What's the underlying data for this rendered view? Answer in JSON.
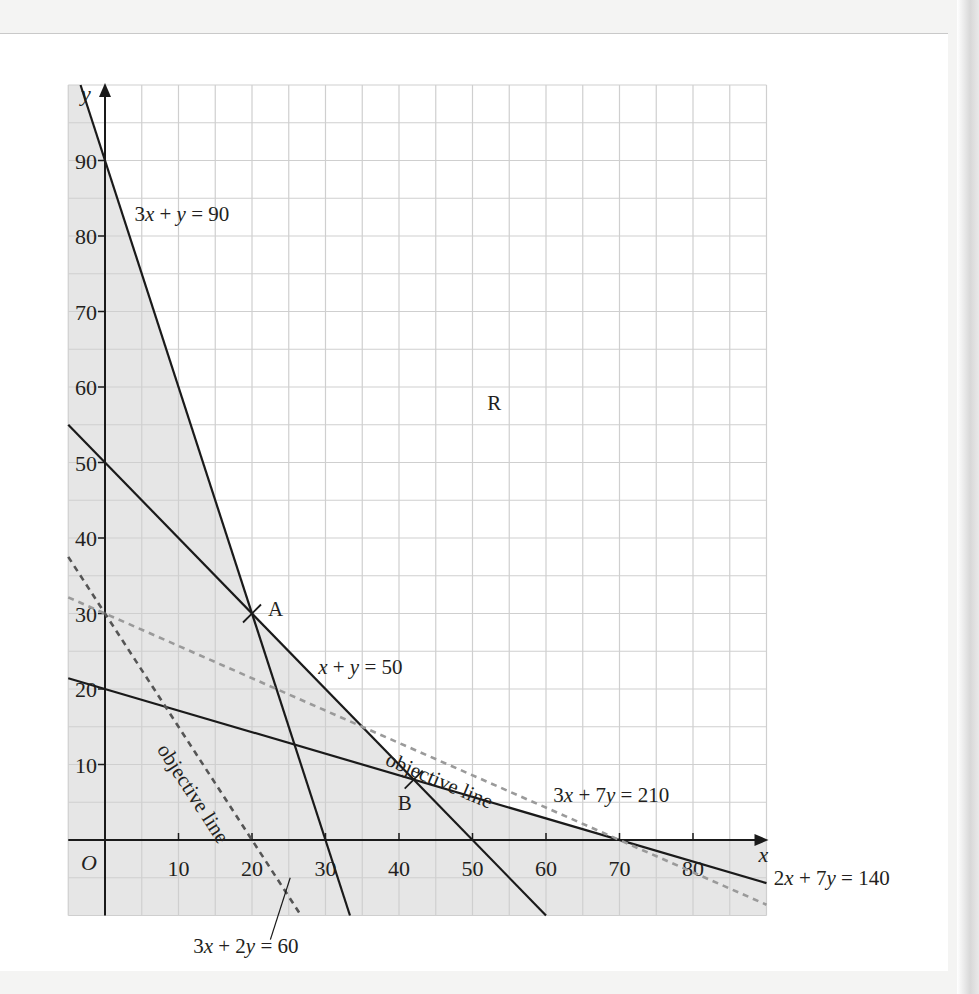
{
  "chart_data": {
    "type": "line",
    "title": "",
    "xlabel": "x",
    "ylabel": "y",
    "origin_label": "O",
    "xlim": [
      -5,
      90
    ],
    "ylim": [
      -10,
      100
    ],
    "grid": {
      "on": true,
      "step": 5
    },
    "x_ticks": [
      10,
      20,
      30,
      40,
      50,
      60,
      70,
      80
    ],
    "y_ticks": [
      10,
      20,
      30,
      40,
      50,
      60,
      70,
      80,
      90
    ],
    "series": [
      {
        "name": "3x + y = 90",
        "style": "solid",
        "color": "#1a1a1a",
        "points": [
          [
            -3.33,
            100
          ],
          [
            33.33,
            -10
          ]
        ]
      },
      {
        "name": "x + y = 50",
        "style": "solid",
        "color": "#1a1a1a",
        "points": [
          [
            -5,
            55
          ],
          [
            60,
            -10
          ]
        ]
      },
      {
        "name": "2x + 7y = 140",
        "style": "solid",
        "color": "#1a1a1a",
        "points": [
          [
            -5,
            21.43
          ],
          [
            90,
            -5.71
          ]
        ]
      },
      {
        "name": "3x + 2y = 60",
        "style": "dashed",
        "color": "#555555",
        "role": "objective line",
        "points": [
          [
            -5,
            37.5
          ],
          [
            26.67,
            -10
          ]
        ]
      },
      {
        "name": "3x + 7y = 210",
        "style": "dashed",
        "color": "#9a9a9a",
        "role": "objective line",
        "points": [
          [
            -5,
            32.14
          ],
          [
            90,
            -8.57
          ]
        ]
      }
    ],
    "points": [
      {
        "label": "A",
        "x": 20,
        "y": 30
      },
      {
        "label": "B",
        "x": 42,
        "y": 8
      }
    ],
    "region": {
      "label": "R",
      "x": 52,
      "y": 57,
      "description": "unshaded feasible region"
    },
    "shading_color": "#e6e6e6",
    "annotations": [
      {
        "text": "3x + y = 90",
        "x": 4,
        "y": 82
      },
      {
        "text": "x + y = 50",
        "x": 29,
        "y": 22
      },
      {
        "text": "objective line",
        "x": 38,
        "y": 10,
        "angle": 23
      },
      {
        "text": "objective line",
        "x": 7,
        "y": 12,
        "angle": 57
      },
      {
        "text": "3x + 7y = 210",
        "x": 61,
        "y": 5
      },
      {
        "text": "2x + 7y = 140",
        "x": 91,
        "y": -6
      },
      {
        "text": "3x + 2y = 60",
        "x": 12,
        "y": -15
      }
    ]
  }
}
